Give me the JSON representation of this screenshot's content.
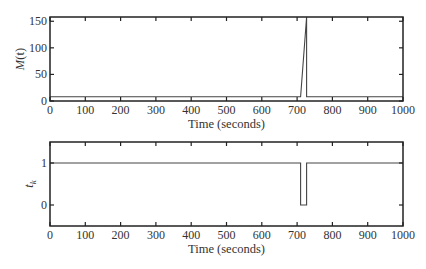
{
  "chart_data": [
    {
      "type": "line",
      "title": "",
      "xlabel": "Time (seconds)",
      "ylabel": "M(t)",
      "xlim": [
        0,
        1000
      ],
      "ylim": [
        0,
        158
      ],
      "xticks": [
        0,
        100,
        200,
        300,
        400,
        500,
        600,
        700,
        800,
        900,
        1000
      ],
      "yticks": [
        0,
        50,
        100,
        150
      ],
      "grid": false,
      "legend": null,
      "series": [
        {
          "name": "M(t)",
          "x": [
            0,
            710,
            727,
            727,
            1000
          ],
          "y": [
            8,
            8,
            158,
            8,
            8
          ]
        }
      ]
    },
    {
      "type": "line",
      "title": "",
      "xlabel": "Time (seconds)",
      "ylabel": "t_k",
      "xlim": [
        0,
        1000
      ],
      "ylim": [
        -0.5,
        1.5
      ],
      "xticks": [
        0,
        100,
        200,
        300,
        400,
        500,
        600,
        700,
        800,
        900,
        1000
      ],
      "yticks": [
        0,
        1
      ],
      "grid": false,
      "legend": null,
      "series": [
        {
          "name": "t_k",
          "x": [
            0,
            710,
            710,
            727,
            727,
            1000
          ],
          "y": [
            1,
            1,
            0,
            0,
            1,
            1
          ]
        }
      ]
    }
  ],
  "panels": [
    {
      "ylabel_main": "M",
      "ylabel_paren": "(t)",
      "xlabel": "Time (seconds)",
      "xtick_labels": [
        "0",
        "100",
        "200",
        "300",
        "400",
        "500",
        "600",
        "700",
        "800",
        "900",
        "1000"
      ],
      "ytick_labels": [
        "0",
        "50",
        "100",
        "150"
      ]
    },
    {
      "ylabel_main": "t",
      "ylabel_sub": "k",
      "xlabel": "Time (seconds)",
      "xtick_labels": [
        "0",
        "100",
        "200",
        "300",
        "400",
        "500",
        "600",
        "700",
        "800",
        "900",
        "1000"
      ],
      "ytick_labels": [
        "0",
        "1"
      ]
    }
  ],
  "colors": {
    "axis": "#222222",
    "line": "#444444",
    "background": "#ffffff"
  }
}
